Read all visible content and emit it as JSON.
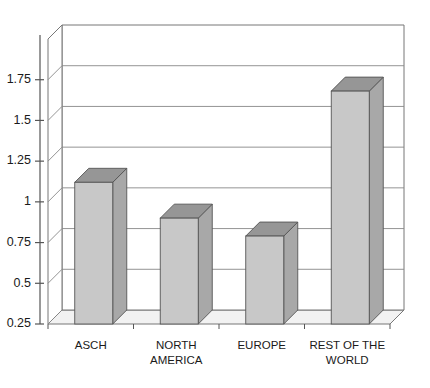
{
  "chart_data": {
    "type": "bar",
    "title": "",
    "subtitle": "",
    "xlabel": "",
    "ylabel": "",
    "categories": [
      "ASCH",
      "NORTH AMERICA",
      "EUROPE",
      "REST OF THE WORLD"
    ],
    "category_lines": [
      [
        "ASCH"
      ],
      [
        "NORTH",
        "AMERICA"
      ],
      [
        "EUROPE"
      ],
      [
        "REST OF THE",
        "WORLD"
      ]
    ],
    "values": [
      1.12,
      0.9,
      0.79,
      1.68
    ],
    "ylim": [
      0.25,
      2.0
    ],
    "yticks": [
      0.25,
      0.5,
      0.75,
      1,
      1.25,
      1.5,
      1.75
    ],
    "ytick_labels": [
      "0.25",
      "0.5",
      "0.75",
      "1",
      "1.25",
      "1.5",
      "1.75"
    ],
    "grid": true,
    "grid_axis": "y",
    "legend": "none",
    "style": "3d-column",
    "colors": {
      "bar_front": "#c8c8c8",
      "bar_side": "#a8a8a8",
      "bar_top": "#969696",
      "bar_edge": "#555555",
      "floor": "#f2f2f2",
      "wall": "#ffffff",
      "grid_line": "#888888",
      "axis_line": "#555555",
      "background": "#ffffff",
      "text": "#1a1a1a"
    }
  }
}
